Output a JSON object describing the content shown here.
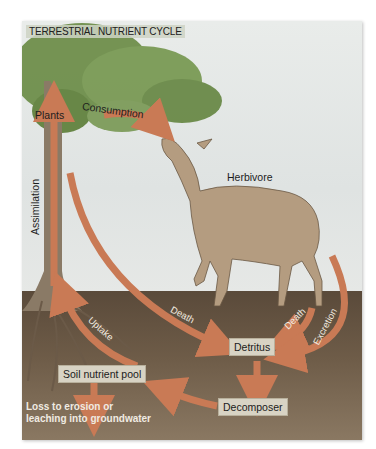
{
  "diagram": {
    "title": "TERRESTRIAL NUTRIENT CYCLE",
    "nodes": {
      "plants": "Plants",
      "herbivore": "Herbivore",
      "detritus": "Detritus",
      "soil_pool": "Soil nutrient pool",
      "decomposer": "Decomposer"
    },
    "arrows": {
      "consumption": "Consumption",
      "assimilation": "Assimilation",
      "plant_death": "Death",
      "herbivore_death": "Death",
      "excretion": "Excretion",
      "uptake": "Uptake"
    },
    "loss_note": {
      "line1": "Loss to erosion or",
      "line2": "leaching into groundwater"
    },
    "colors": {
      "arrow": "#c97a55",
      "soil": "#5a4a3a",
      "foliage": "#6f8f4c",
      "trunk": "#8a7a66",
      "label_box": "#d8d3c4"
    }
  }
}
